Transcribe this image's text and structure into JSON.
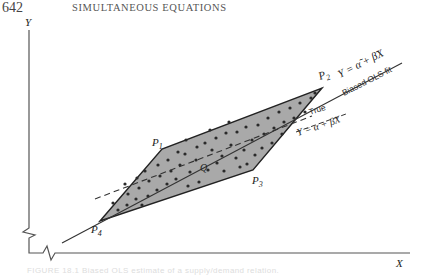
{
  "page": {
    "number": "642",
    "running_title": "SIMULTANEOUS EQUATIONS"
  },
  "figure": {
    "y_axis_label": "Y",
    "x_axis_label": "X",
    "points": {
      "p1": "P",
      "p1_sub": "1",
      "p2": "P",
      "p2_sub": "2",
      "p3": "P",
      "p3_sub": "3",
      "p4": "P",
      "p4_sub": "4",
      "q": "Q"
    },
    "biased_line": {
      "equation": "Y = α̃ + β̃X",
      "label": "Biased OLS fit"
    },
    "true_line": {
      "label": "True",
      "equation": "Y = α + βX"
    },
    "colors": {
      "region_fill": "#a9a9a9",
      "line": "#333333",
      "dots": "#2a2a2a"
    }
  },
  "caption": {
    "text": "FIGURE 18.1 Biased OLS estimate of a supply/demand relation."
  }
}
